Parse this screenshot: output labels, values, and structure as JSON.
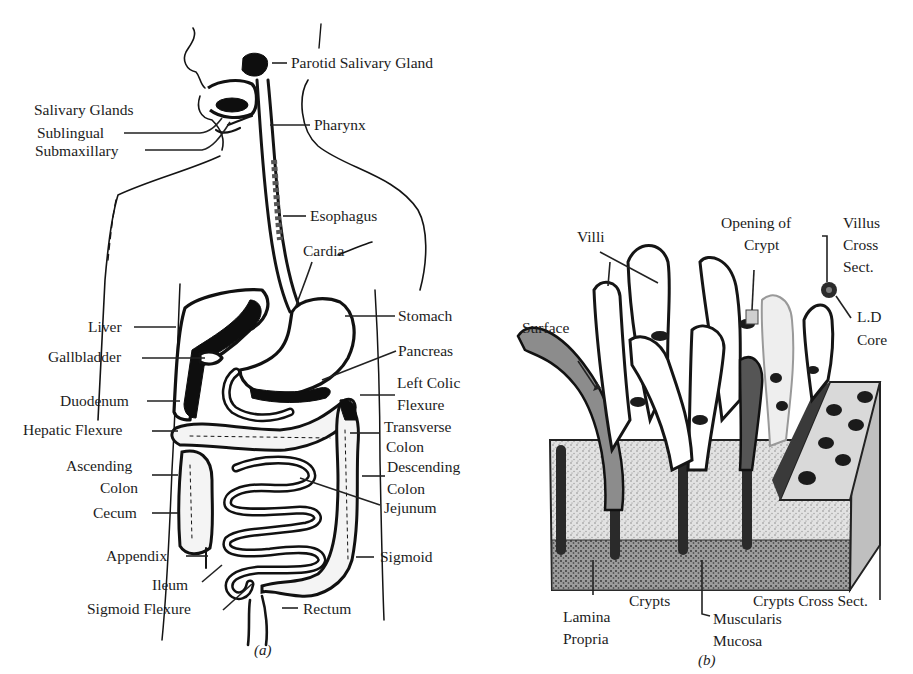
{
  "figure": {
    "panels": [
      {
        "id": "a",
        "caption": "(a)",
        "subject": "human digestive system",
        "labels": {
          "parotid": "Parotid Salivary Gland",
          "salivary_glands": "Salivary Glands",
          "sublingual": "Sublingual",
          "submaxillary": "Submaxillary",
          "pharynx": "Pharynx",
          "esophagus": "Esophagus",
          "cardia": "Cardia",
          "stomach": "Stomach",
          "liver": "Liver",
          "gallbladder": "Gallbladder",
          "pancreas": "Pancreas",
          "left_colic_1": "Left Colic",
          "left_colic_2": "Flexure",
          "duodenum": "Duodenum",
          "hepatic_flexure": "Hepatic Flexure",
          "transverse_1": "Transverse",
          "transverse_2": "Colon",
          "ascending_1": "Ascending",
          "ascending_2": "Colon",
          "descending_1": "Descending",
          "descending_2": "Colon",
          "jejunum": "Jejunum",
          "cecum": "Cecum",
          "appendix": "Appendix",
          "sigmoid": "Sigmoid",
          "ileum": "Ileum",
          "sigmoid_flexure": "Sigmoid Flexure",
          "rectum": "Rectum"
        }
      },
      {
        "id": "b",
        "caption": "(b)",
        "subject": "intestinal mucosa block",
        "labels": {
          "villi": "Villi",
          "opening_1": "Opening of",
          "opening_2": "Crypt",
          "villus_cs_1": "Villus",
          "villus_cs_2": "Cross",
          "villus_cs_3": "Sect.",
          "ld_1": "L.D",
          "ld_2": "Core",
          "surface": "Surface",
          "lamina_1": "Lamina",
          "lamina_2": "Propria",
          "crypts": "Crypts",
          "crypts_cross": "Crypts Cross Sect.",
          "muscularis_1": "Muscularis",
          "muscularis_2": "Mucosa"
        }
      }
    ]
  }
}
